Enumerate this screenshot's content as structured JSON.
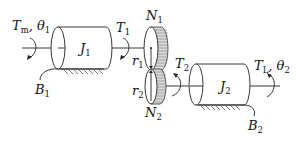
{
  "diagram": {
    "labels": {
      "motor_torque": {
        "main": "T",
        "sub": "m",
        "suffix": ", θ",
        "suffix_sub": "1"
      },
      "inertia1": {
        "main": "J",
        "sub": "1"
      },
      "damper1": {
        "main": "B",
        "sub": "1"
      },
      "torque1": {
        "main": "T",
        "sub": "1"
      },
      "gear1_teeth": {
        "main": "N",
        "sub": "1"
      },
      "radius1": {
        "main": "r",
        "sub": "1"
      },
      "radius2": {
        "main": "r",
        "sub": "2"
      },
      "gear2_teeth": {
        "main": "N",
        "sub": "2"
      },
      "torque2": {
        "main": "T",
        "sub": "2"
      },
      "inertia2": {
        "main": "J",
        "sub": "2"
      },
      "load_torque": {
        "main": "T",
        "sub": "L",
        "suffix": ", θ",
        "suffix_sub": "2"
      },
      "damper2": {
        "main": "B",
        "sub": "2"
      }
    },
    "colors": {
      "line": "#222222",
      "gear_rim": "#d9d9d9",
      "background": "#ffffff"
    }
  }
}
